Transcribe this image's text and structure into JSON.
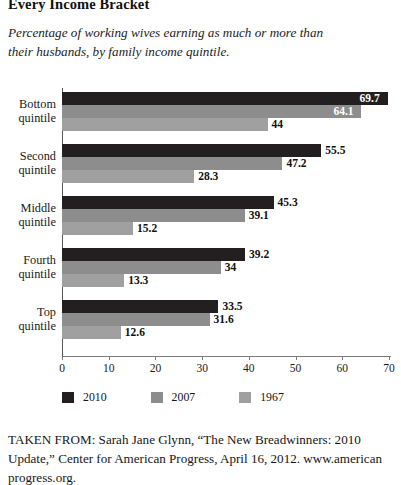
{
  "heading": {
    "title": "Every Income Bracket",
    "subtitle": "Percentage of working wives earning as much or more than their husbands, by family income quintile."
  },
  "source": {
    "text": "TAKEN FROM: Sarah Jane Glynn, “The New Breadwinners: 2010 Update,” Center for American Progress, April 16, 2012. www.american progress.org."
  },
  "colors": {
    "series_2010": "#231f20",
    "series_2007": "#8d8d8d",
    "series_1967": "#a0a0a0",
    "axis": "#7b7b7b",
    "text": "#1a1a1a"
  },
  "chart_data": {
    "type": "bar",
    "orientation": "horizontal",
    "title": "Every Income Bracket",
    "subtitle": "Percentage of working wives earning as much or more than their husbands, by family income quintile.",
    "xlabel": "",
    "ylabel": "",
    "xlim": [
      0,
      70
    ],
    "xticks": [
      0,
      10,
      20,
      30,
      40,
      50,
      60,
      70
    ],
    "grid": false,
    "legend_position": "bottom-left",
    "categories": [
      "Bottom quintile",
      "Second quintile",
      "Middle quintile",
      "Fourth quintile",
      "Top quintile"
    ],
    "category_lines": [
      [
        "Bottom",
        "quintile"
      ],
      [
        "Second",
        "quintile"
      ],
      [
        "Middle",
        "quintile"
      ],
      [
        "Fourth",
        "quintile"
      ],
      [
        "Top",
        "quintile"
      ]
    ],
    "series": [
      {
        "name": "2010",
        "color": "#231f20",
        "values": [
          69.7,
          55.5,
          45.3,
          39.2,
          33.5
        ],
        "labels": [
          "69.7",
          "55.5",
          "45.3",
          "39.2",
          "33.5"
        ]
      },
      {
        "name": "2007",
        "color": "#8d8d8d",
        "values": [
          64.1,
          47.2,
          39.1,
          34,
          31.6
        ],
        "labels": [
          "64.1",
          "47.2",
          "39.1",
          "34",
          "31.6"
        ]
      },
      {
        "name": "1967",
        "color": "#a0a0a0",
        "values": [
          44,
          28.3,
          15.2,
          13.3,
          12.6
        ],
        "labels": [
          "44",
          "28.3",
          "15.2",
          "13.3",
          "12.6"
        ]
      }
    ]
  }
}
